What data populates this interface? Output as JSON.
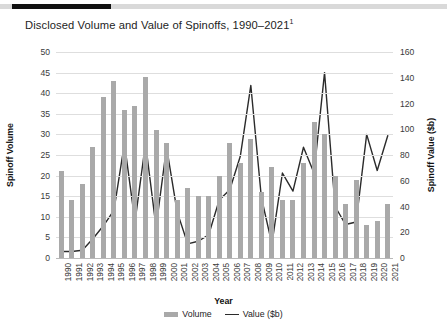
{
  "header": {
    "accent_color": "#111111",
    "rule_color": "#d9d9d9"
  },
  "title": {
    "text": "Disclosed Volume and Value of Spinoffs, 1990–2021",
    "footnote_marker": "1"
  },
  "axes": {
    "x_label": "Year",
    "y_left_label": "Spinoff Volume",
    "y_right_label": "Spinoff Value ($b)",
    "y_left_ticks": [
      0,
      5,
      10,
      15,
      20,
      25,
      30,
      35,
      40,
      45,
      50
    ],
    "y_right_ticks": [
      0,
      20,
      40,
      60,
      80,
      100,
      120,
      140,
      160
    ]
  },
  "legend": {
    "position": "bottom-center",
    "items": [
      {
        "label": "Volume",
        "marker": "bar",
        "color": "#a9a9a9"
      },
      {
        "label": "Value ($b)",
        "marker": "line",
        "color": "#2b2b2b"
      }
    ]
  },
  "chart_data": {
    "type": "bar",
    "title": "Disclosed Volume and Value of Spinoffs, 1990–2021",
    "xlabel": "Year",
    "ylabel": "Spinoff Volume",
    "y2label": "Spinoff Value ($b)",
    "ylim": [
      0,
      50
    ],
    "y2lim": [
      0,
      160
    ],
    "grid": true,
    "categories": [
      "1990",
      "1991",
      "1992",
      "1993",
      "1994",
      "1995",
      "1996",
      "1997",
      "1998",
      "1999",
      "2000",
      "2001",
      "2002",
      "2003",
      "2004",
      "2005",
      "2006",
      "2007",
      "2008",
      "2009",
      "2010",
      "2011",
      "2012",
      "2013",
      "2014",
      "2015",
      "2016",
      "2017",
      "2018",
      "2019",
      "2020",
      "2021"
    ],
    "series": [
      {
        "name": "Volume",
        "type": "bar",
        "axis": "left",
        "color": "#a9a9a9",
        "values": [
          21,
          14,
          18,
          27,
          39,
          43,
          36,
          37,
          44,
          31,
          28,
          14,
          17,
          15,
          15,
          20,
          28,
          23,
          29,
          16,
          22,
          14,
          14,
          23,
          33,
          30,
          20,
          13,
          19,
          8,
          9,
          13
        ]
      },
      {
        "name": "Value ($b)",
        "type": "line",
        "axis": "right",
        "color": "#2b2b2b",
        "values": [
          5,
          5,
          6,
          15,
          25,
          37,
          89,
          28,
          89,
          24,
          86,
          36,
          11,
          13,
          18,
          45,
          53,
          79,
          134,
          47,
          11,
          66,
          52,
          86,
          66,
          144,
          40,
          26,
          28,
          96,
          68,
          95
        ]
      }
    ]
  }
}
